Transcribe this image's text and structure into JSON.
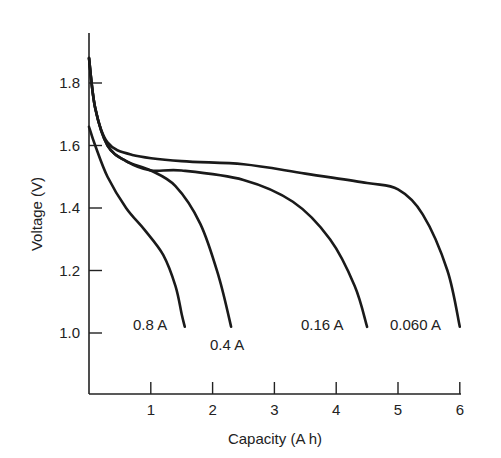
{
  "chart_data": {
    "type": "line",
    "title": "",
    "xlabel": "Capacity (A h)",
    "ylabel": "Voltage (V)",
    "xlim": [
      0,
      6
    ],
    "ylim": [
      0.8,
      1.95
    ],
    "grid": false,
    "legend_position": "inline labels at curve ends",
    "x_ticks": [
      1,
      2,
      3,
      4,
      5,
      6
    ],
    "x_tick_labels": [
      "1",
      "2",
      "3",
      "4",
      "5",
      "6"
    ],
    "y_ticks": [
      1.0,
      1.2,
      1.4,
      1.6,
      1.8
    ],
    "y_tick_labels": [
      "1.0",
      "1.2",
      "1.4",
      "1.6",
      "1.8"
    ],
    "series": [
      {
        "name": "0.8 A",
        "x": [
          0,
          0.1,
          0.3,
          0.6,
          0.9,
          1.2,
          1.4,
          1.5,
          1.55
        ],
        "y": [
          1.66,
          1.6,
          1.5,
          1.4,
          1.33,
          1.25,
          1.15,
          1.06,
          1.02
        ]
      },
      {
        "name": "0.4 A",
        "x": [
          0,
          0.1,
          0.3,
          0.6,
          1.0,
          1.4,
          1.8,
          2.1,
          2.3
        ],
        "y": [
          1.88,
          1.72,
          1.6,
          1.55,
          1.52,
          1.47,
          1.35,
          1.18,
          1.02
        ]
      },
      {
        "name": "0.16 A",
        "x": [
          0,
          0.1,
          0.3,
          0.6,
          1.0,
          1.5,
          2.5,
          3.3,
          3.9,
          4.3,
          4.5
        ],
        "y": [
          1.88,
          1.72,
          1.6,
          1.55,
          1.52,
          1.52,
          1.49,
          1.42,
          1.3,
          1.15,
          1.02
        ]
      },
      {
        "name": "0.060 A",
        "x": [
          0,
          0.1,
          0.3,
          0.7,
          1.5,
          2.5,
          3.5,
          4.5,
          5.0,
          5.4,
          5.8,
          6.0
        ],
        "y": [
          1.88,
          1.72,
          1.61,
          1.57,
          1.55,
          1.54,
          1.51,
          1.48,
          1.46,
          1.38,
          1.2,
          1.02
        ]
      }
    ],
    "annotations": [
      {
        "text": "0.8 A",
        "at_x": 1.55,
        "at_y": 1.02
      },
      {
        "text": "0.4 A",
        "at_x": 2.3,
        "at_y": 1.02
      },
      {
        "text": "0.16 A",
        "at_x": 4.5,
        "at_y": 1.02
      },
      {
        "text": "0.060 A",
        "at_x": 6.0,
        "at_y": 1.02
      }
    ]
  }
}
